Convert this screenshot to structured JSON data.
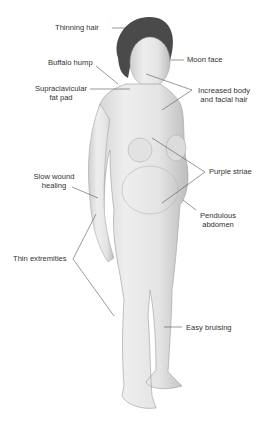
{
  "figure": {
    "labels": [
      {
        "id": "thinning-hair",
        "text": "Thinning hair"
      },
      {
        "id": "moon-face",
        "text": "Moon face"
      },
      {
        "id": "buffalo-hump",
        "text": "Buffalo hump"
      },
      {
        "id": "supraclavicular",
        "line1": "Supraclavicular",
        "line2": "fat pad"
      },
      {
        "id": "increased-hair",
        "line1": "Increased body",
        "line2": "and facial hair"
      },
      {
        "id": "purple-striae",
        "text": "Purple striae"
      },
      {
        "id": "slow-wound",
        "line1": "Slow wound",
        "line2": "healing"
      },
      {
        "id": "pendulous",
        "line1": "Pendulous",
        "line2": "abdomen"
      },
      {
        "id": "thin-extremities",
        "text": "Thin extremities"
      },
      {
        "id": "easy-bruising",
        "text": "Easy bruising"
      }
    ],
    "colors": {
      "line": "#555555",
      "text": "#333333",
      "skin": "#e9e9e9",
      "skin_shade": "#c9c9c9",
      "hair": "#4a4a4a"
    }
  }
}
